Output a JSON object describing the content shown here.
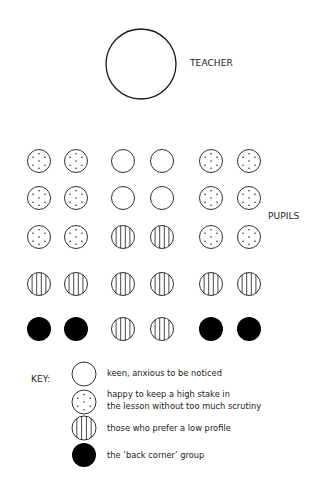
{
  "teacher": {
    "label": "TEACHER"
  },
  "pupils": {
    "label": "PUPILS",
    "columns_x": [
      39,
      76,
      123,
      162,
      211,
      249
    ],
    "rows_y": [
      161,
      198,
      237,
      284,
      329
    ],
    "grid": [
      [
        "dotted",
        "dotted",
        "open",
        "open",
        "dotted",
        "dotted"
      ],
      [
        "dotted",
        "dotted",
        "open",
        "open",
        "dotted",
        "dotted"
      ],
      [
        "dotted",
        "dotted",
        "striped",
        "striped",
        "dotted",
        "dotted"
      ],
      [
        "striped",
        "striped",
        "striped",
        "striped",
        "striped",
        "striped"
      ],
      [
        "black",
        "black",
        "striped",
        "striped",
        "black",
        "black"
      ]
    ]
  },
  "key": {
    "title": "KEY:",
    "items": [
      {
        "symbol": "open",
        "text": "keen, anxious to be noticed"
      },
      {
        "symbol": "dotted",
        "text_line1": "happy to keep a high stake in",
        "text_line2": "the lesson without too much scrutiny"
      },
      {
        "symbol": "striped",
        "text": "those who prefer a low profile"
      },
      {
        "symbol": "black",
        "text": "the ‘back corner’ group"
      }
    ]
  },
  "colors": {
    "stroke": "#1a1a1a",
    "fill_black": "#000000",
    "background": "#ffffff"
  }
}
